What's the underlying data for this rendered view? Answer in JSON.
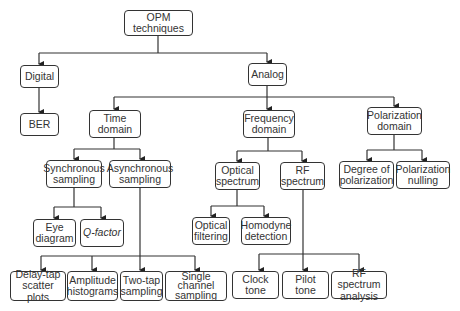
{
  "diagram": {
    "type": "tree",
    "root": "OPM techniques",
    "nodes": {
      "opm": "OPM\ntechniques",
      "digital": "Digital",
      "ber": "BER",
      "analog": "Analog",
      "time": "Time\ndomain",
      "frequency": "Frequency\ndomain",
      "polarization": "Polarization\ndomain",
      "sync": "Synchronous\nsampling",
      "async": "Asynchronous\nsampling",
      "optical_spectrum": "Optical\nspectrum",
      "rf_spectrum": "RF\nspectrum",
      "dop": "Degree of\npolarization",
      "pol_nulling": "Polarization\nnulling",
      "eye": "Eye\ndiagram",
      "qfactor": "Q-factor",
      "opt_filter": "Optical\nfiltering",
      "homodyne": "Homodyne\ndetection",
      "delay_tap": "Delay-tap\nscatter plots",
      "amplitude": "Amplitude\nhistograms",
      "two_tap": "Two-tap\nsampling",
      "single_channel": "Single\nchannel\nsampling",
      "clock_tone": "Clock tone",
      "pilot_tone": "Pilot tone",
      "rf_analysis": "RF spectrum\nanalysis"
    },
    "edges": [
      [
        "OPM techniques",
        "Digital"
      ],
      [
        "OPM techniques",
        "Analog"
      ],
      [
        "Digital",
        "BER"
      ],
      [
        "Analog",
        "Time domain"
      ],
      [
        "Analog",
        "Frequency domain"
      ],
      [
        "Analog",
        "Polarization domain"
      ],
      [
        "Time domain",
        "Synchronous sampling"
      ],
      [
        "Time domain",
        "Asynchronous sampling"
      ],
      [
        "Synchronous sampling",
        "Eye diagram"
      ],
      [
        "Synchronous sampling",
        "Q-factor"
      ],
      [
        "Asynchronous sampling",
        "Delay-tap scatter plots"
      ],
      [
        "Asynchronous sampling",
        "Amplitude histograms"
      ],
      [
        "Asynchronous sampling",
        "Two-tap sampling"
      ],
      [
        "Asynchronous sampling",
        "Single channel sampling"
      ],
      [
        "Frequency domain",
        "Optical spectrum"
      ],
      [
        "Frequency domain",
        "RF spectrum"
      ],
      [
        "Optical spectrum",
        "Optical filtering"
      ],
      [
        "Optical spectrum",
        "Homodyne detection"
      ],
      [
        "RF spectrum",
        "Clock tone"
      ],
      [
        "RF spectrum",
        "Pilot tone"
      ],
      [
        "RF spectrum",
        "RF spectrum analysis"
      ],
      [
        "Polarization domain",
        "Degree of polarization"
      ],
      [
        "Polarization domain",
        "Polarization nulling"
      ]
    ]
  }
}
